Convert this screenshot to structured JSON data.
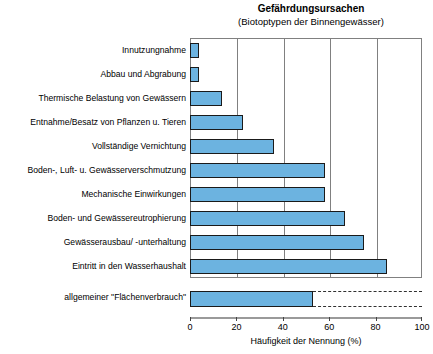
{
  "chart_data": {
    "type": "bar",
    "orientation": "horizontal",
    "title": "Gefährdungsursachen",
    "subtitle": "(Biotoptypen der Binnengewässer)",
    "xlabel": "Häufigkeit der Nennung (%)",
    "ylabel": "",
    "xlim": [
      0,
      100
    ],
    "xticks": [
      0,
      20,
      40,
      60,
      80,
      100
    ],
    "xtick_labels": [
      "0",
      "20",
      "40",
      "60",
      "80",
      "100"
    ],
    "grid": true,
    "grid_axis": "x",
    "legend": false,
    "bar_color": "#6cb3e0",
    "bar_edge_color": "#1a1a1a",
    "categories": [
      "Innutzungnahme",
      "Abbau und Abgrabung",
      "Thermische Belastung von Gewässern",
      "Entnahme/Besatz von Pflanzen u. Tieren",
      "Vollständige Vernichtung",
      "Boden-, Luft- u. Gewässerverschmutzung",
      "Mechanische Einwirkungen",
      "Boden- und Gewässereutrophierung",
      "Gewässerausbau/ -unterhaltung",
      "Eintritt in den Wasserhaushalt"
    ],
    "values": [
      4,
      4,
      14,
      23,
      36,
      58,
      58,
      67,
      75,
      85
    ],
    "separate_category": {
      "label": "allgemeiner \"Flächenverbrauch\"",
      "value": 53,
      "dashed_extension_to": 100,
      "note": "plotted below the main axis frame with dashed continuation"
    }
  }
}
